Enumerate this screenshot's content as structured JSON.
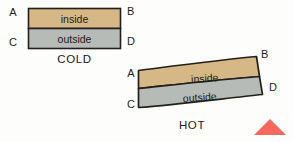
{
  "figure": {
    "background_color": "#fdfdfb"
  },
  "colors": {
    "inside_fill": "#d6b887",
    "outside_fill": "#b7bbb7",
    "outline": "#231f1c",
    "text": "#1c1a18",
    "triangle": "#f4685e"
  },
  "cold_diagram": {
    "state_label": "COLD",
    "inside_label": "inside",
    "outside_label": "outside",
    "corner_top_left": "A",
    "corner_top_right": "B",
    "corner_bottom_left": "C",
    "corner_bottom_right": "D"
  },
  "hot_diagram": {
    "state_label": "HOT",
    "inside_label": "inside",
    "outside_label": "outside",
    "corner_top_left": "A",
    "corner_top_right": "B",
    "corner_bottom_left": "C",
    "corner_bottom_right": "D"
  },
  "marker": {
    "shape_name": "triangle-up",
    "color": "#f4685e"
  }
}
